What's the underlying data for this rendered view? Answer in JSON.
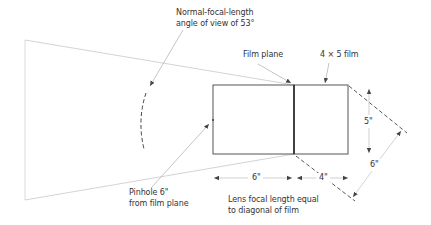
{
  "diagram": {
    "labels": {
      "normal_focal_line1": "Normal-focal-length",
      "normal_focal_line2": "angle of view of 53°",
      "film_plane": "Film plane",
      "film_format": "4 × 5 film",
      "pinhole_line1": "Pinhole 6\"",
      "pinhole_line2": "from film plane",
      "lens_focal_line1": "Lens focal length equal",
      "lens_focal_line2": "to diagonal of film"
    },
    "dimensions": {
      "pinhole_to_film": "6\"",
      "film_width": "4\"",
      "film_height": "5\"",
      "film_diagonal": "6\""
    },
    "colors": {
      "box_stroke": "#555555",
      "light_line": "#c8c8c8",
      "dashed": "#444444",
      "leader": "#9a9a9a",
      "text": "#333333"
    }
  }
}
